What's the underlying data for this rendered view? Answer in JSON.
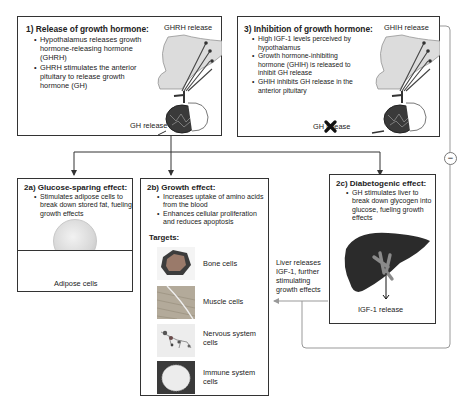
{
  "box1": {
    "title": "1) Release of growth hormone:",
    "bullets": [
      "Hypothalamus releases growth hormone-releasing hormone (GHRH)",
      "GHRH stimulates the anterior pituitary to release growth hormone (GH)"
    ],
    "top_label": "GHRH release",
    "bottom_label": "GH release"
  },
  "box3": {
    "title": "3) Inhibition of growth hormone:",
    "bullets": [
      "High IGF-1 levels perceived by hypothalamus",
      "Growth hormone-inhibiting hormone (GHIH) is released to inhibit GH release",
      "GHIH inhibits GH release in the anterior pituitary"
    ],
    "top_label": "GHIH release",
    "bottom_label": "GH release",
    "bottom_label_blocked": true
  },
  "box2a": {
    "title": "2a) Glucose-sparing effect:",
    "bullets": [
      "Stimulates adipose cells to break down stored fat, fueling growth effects"
    ],
    "image_label": "Adipose cells"
  },
  "box2b": {
    "title": "2b) Growth effect:",
    "bullets": [
      "Increases uptake of amino acids from the blood",
      "Enhances cellular proliferation and reduces apoptosis"
    ],
    "targets_heading": "Targets:",
    "targets": [
      {
        "label": "Bone cells"
      },
      {
        "label": "Muscle cells"
      },
      {
        "label": "Nervous system cells"
      },
      {
        "label": "Immune system cells"
      }
    ]
  },
  "box2c": {
    "title": "2c) Diabetogenic effect:",
    "bullets": [
      "GH stimulates liver to break down glycogen into glucose, fueling growth effects"
    ],
    "image_label": "IGF-1 release"
  },
  "liver_note": "Liver releases IGF-1, further stimulating growth effects",
  "feedback_symbol": "−",
  "colors": {
    "border": "#333333",
    "feedback_line": "#999999",
    "liver": "#2b2b2b",
    "gallbladder": "#8a8a8a"
  }
}
